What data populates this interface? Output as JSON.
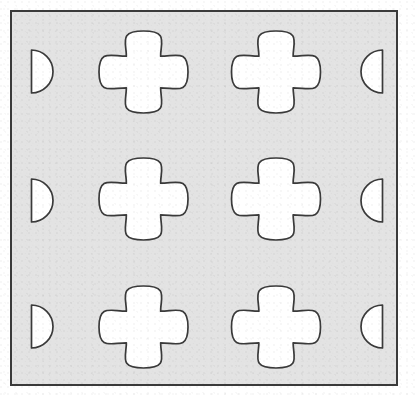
{
  "figure": {
    "canvas": {
      "width": 418,
      "height": 396
    },
    "colors": {
      "plate_fill": "#e3e3e3",
      "hole_fill": "#ffffff",
      "outline": "#3a3a3a",
      "page_background": "#ffffff"
    },
    "plate": {
      "name": "plate-body",
      "x": 11,
      "y": 11,
      "width": 386,
      "height": 374,
      "stroke_width": 2
    },
    "quatrefoils": [
      {
        "id": "quatrefoil-r1-c1",
        "row": 1,
        "col": 1,
        "cx": 143.5,
        "cy": 72,
        "rx": 44.5,
        "ry": 41
      },
      {
        "id": "quatrefoil-r1-c2",
        "row": 1,
        "col": 2,
        "cx": 276,
        "cy": 72,
        "rx": 44.5,
        "ry": 41
      },
      {
        "id": "quatrefoil-r2-c1",
        "row": 2,
        "col": 1,
        "cx": 143.5,
        "cy": 199,
        "rx": 44.5,
        "ry": 41
      },
      {
        "id": "quatrefoil-r2-c2",
        "row": 2,
        "col": 2,
        "cx": 276,
        "cy": 199,
        "rx": 44.5,
        "ry": 41
      },
      {
        "id": "quatrefoil-r3-c1",
        "row": 3,
        "col": 1,
        "cx": 143.5,
        "cy": 327,
        "rx": 44.5,
        "ry": 41
      },
      {
        "id": "quatrefoil-r3-c2",
        "row": 3,
        "col": 2,
        "cx": 276,
        "cy": 327,
        "rx": 44.5,
        "ry": 41
      }
    ],
    "half_circles": [
      {
        "id": "half-circle-left-1",
        "side": "left",
        "row": 1,
        "flat_x": 31.5,
        "cy": 71.5,
        "r": 21.5,
        "bulge": "right"
      },
      {
        "id": "half-circle-left-2",
        "side": "left",
        "row": 2,
        "flat_x": 31.5,
        "cy": 200.5,
        "r": 21.5,
        "bulge": "right"
      },
      {
        "id": "half-circle-left-3",
        "side": "left",
        "row": 3,
        "flat_x": 31.5,
        "cy": 326.5,
        "r": 21.5,
        "bulge": "right"
      },
      {
        "id": "half-circle-right-1",
        "side": "right",
        "row": 1,
        "flat_x": 382.5,
        "cy": 71.5,
        "r": 21.5,
        "bulge": "left"
      },
      {
        "id": "half-circle-right-2",
        "side": "right",
        "row": 2,
        "flat_x": 382.5,
        "cy": 200.5,
        "r": 21.5,
        "bulge": "left"
      },
      {
        "id": "half-circle-right-3",
        "side": "right",
        "row": 3,
        "flat_x": 382.5,
        "cy": 326.5,
        "r": 21.5,
        "bulge": "left"
      }
    ],
    "counts": {
      "quatrefoil_holes": 6,
      "half_circle_notches": 6,
      "grid_rows": 3,
      "grid_cols": 2
    }
  }
}
